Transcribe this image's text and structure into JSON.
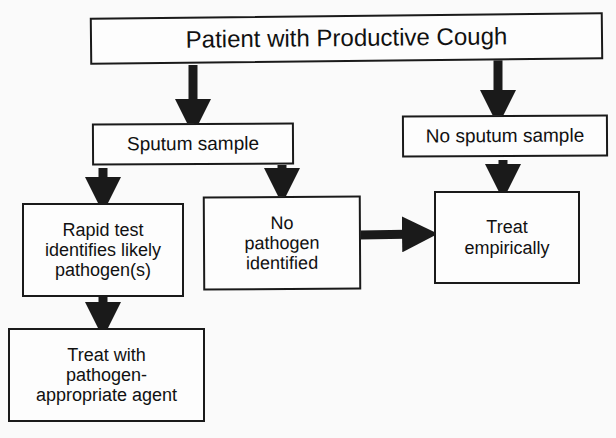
{
  "diagram": {
    "type": "flowchart",
    "nodes": {
      "root": "Patient with Productive Cough",
      "sputum": "Sputum sample",
      "no_sputum": "No sputum sample",
      "rapid": "Rapid test\nidentifies likely\npathogen(s)",
      "no_pathogen": "No\npathogen\nidentified",
      "empiric": "Treat\nempirically",
      "treat_agent": "Treat with\npathogen-\nappropriate agent"
    },
    "edges": [
      {
        "from": "root",
        "to": "sputum"
      },
      {
        "from": "root",
        "to": "no_sputum"
      },
      {
        "from": "sputum",
        "to": "rapid"
      },
      {
        "from": "sputum",
        "to": "no_pathogen"
      },
      {
        "from": "no_sputum",
        "to": "empiric"
      },
      {
        "from": "no_pathogen",
        "to": "empiric"
      },
      {
        "from": "rapid",
        "to": "treat_agent"
      }
    ],
    "colors": {
      "stroke": "#1a1a1a",
      "background": "#fafafa"
    }
  }
}
